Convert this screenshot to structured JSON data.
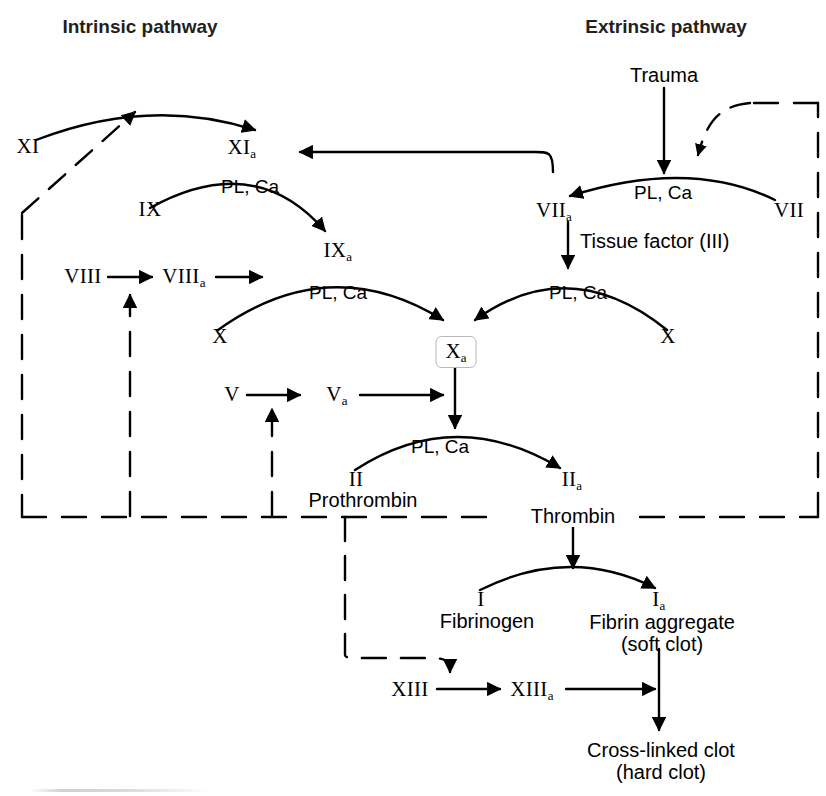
{
  "figure": {
    "kind": "coagulation-cascade-diagram",
    "background_color": "#ffffff",
    "ink_color": "#000000",
    "box_border_color": "#b8b8b8"
  },
  "titles": {
    "intrinsic": "Intrinsic pathway",
    "extrinsic": "Extrinsic pathway"
  },
  "nodes": {
    "xi": {
      "label": "XI",
      "sub": ""
    },
    "xia": {
      "label": "XI",
      "sub": "a"
    },
    "ix": {
      "label": "IX",
      "sub": ""
    },
    "ixa": {
      "label": "IX",
      "sub": "a"
    },
    "viii": {
      "label": "VIII",
      "sub": ""
    },
    "viiia": {
      "label": "VIII",
      "sub": "a"
    },
    "x_left": {
      "label": "X",
      "sub": ""
    },
    "x_right": {
      "label": "X",
      "sub": ""
    },
    "xa": {
      "label": "X",
      "sub": "a"
    },
    "vii": {
      "label": "VII",
      "sub": ""
    },
    "viia": {
      "label": "VII",
      "sub": "a"
    },
    "v": {
      "label": "V",
      "sub": ""
    },
    "va": {
      "label": "V",
      "sub": "a"
    },
    "ii": {
      "label": "II",
      "sub": ""
    },
    "iia": {
      "label": "II",
      "sub": "a"
    },
    "i": {
      "label": "I",
      "sub": ""
    },
    "ia": {
      "label": "I",
      "sub": "a"
    },
    "xiii": {
      "label": "XIII",
      "sub": ""
    },
    "xiiia": {
      "label": "XIII",
      "sub": "a"
    }
  },
  "names": {
    "trauma": "Trauma",
    "tissue_factor": "Tissue factor (III)",
    "prothrombin": "Prothrombin",
    "thrombin": "Thrombin",
    "fibrinogen": "Fibrinogen",
    "fibrin_aggregate_line1": "Fibrin aggregate",
    "fibrin_aggregate_line2": "(soft clot)",
    "crosslinked_line1": "Cross-linked clot",
    "crosslinked_line2": "(hard clot)"
  },
  "cofactors": {
    "xi_to_ixa": "PL, Ca",
    "vii_to_viia": "PL, Ca",
    "ixa_to_xa": "PL, Ca",
    "viia_to_xa": "PL, Ca",
    "xa_to_iia": "PL, Ca"
  }
}
